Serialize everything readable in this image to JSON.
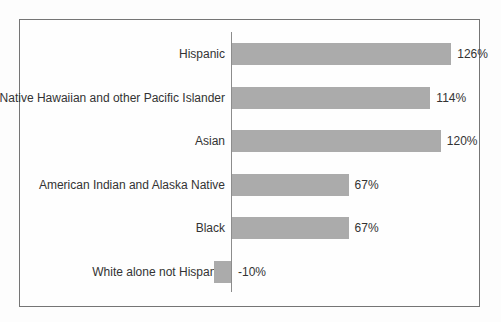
{
  "chart_data": {
    "type": "bar",
    "orientation": "horizontal",
    "title": "",
    "xlabel": "",
    "ylabel": "",
    "categories": [
      "Hispanic",
      "Native Hawaiian and other Pacific Islander",
      "Asian",
      "American Indian and Alaska Native",
      "Black",
      "White alone not Hispanic"
    ],
    "values": [
      126,
      114,
      120,
      67,
      67,
      -10
    ],
    "value_labels": [
      "126%",
      "114%",
      "120%",
      "67%",
      "67%",
      "-10%"
    ],
    "xlim": [
      -20,
      140
    ],
    "grid": false,
    "legend": "none",
    "baseline_at": 0,
    "bar_color": "#ababab",
    "axis_line_color": "#8c8c8c",
    "frame_border_color": "#757575",
    "text_color": "#333333"
  }
}
